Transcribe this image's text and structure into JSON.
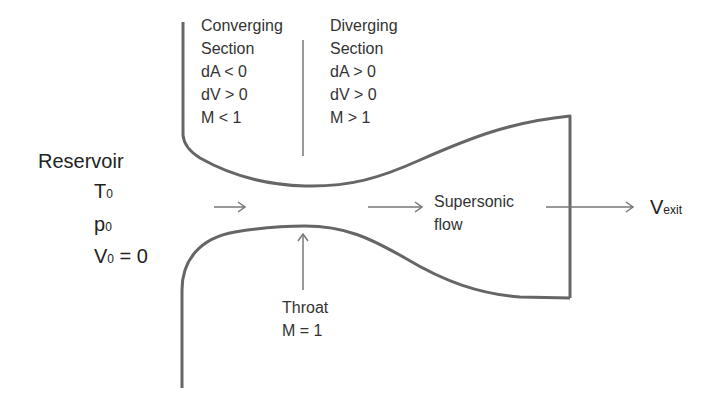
{
  "converging": {
    "title1": "Converging",
    "title2": "Section",
    "dA": "dA < 0",
    "dV": "dV > 0",
    "M": "M < 1"
  },
  "diverging": {
    "title1": "Diverging",
    "title2": "Section",
    "dA": "dA > 0",
    "dV": "dV > 0",
    "M": "M > 1"
  },
  "reservoir": {
    "title": "Reservoir",
    "T": "T",
    "T_sub": "0",
    "p": "p",
    "p_sub": "0",
    "V": "V",
    "V_sub": "0",
    "V_rest": " = 0"
  },
  "flow": {
    "line1": "Supersonic",
    "line2": "flow"
  },
  "exit": {
    "V": "V",
    "sub": "exit"
  },
  "throat": {
    "line1": "Throat",
    "line2": "M = 1"
  },
  "colors": {
    "wall": "#666666",
    "arrow": "#777777",
    "text": "#333333"
  }
}
